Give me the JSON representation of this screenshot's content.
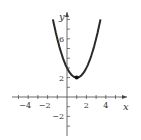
{
  "chart_data": {
    "type": "line",
    "title": "",
    "xlabel": "x",
    "ylabel": "y",
    "function": "y = x^2 - 2x + 3",
    "x": [
      -1.4,
      -1,
      -0.5,
      0,
      0.5,
      1,
      1.5,
      2,
      2.5,
      3,
      3.4
    ],
    "series": [
      {
        "name": "f(x)",
        "values": [
          7.76,
          6,
          4.25,
          3,
          2.25,
          2,
          2.25,
          3,
          4.25,
          6,
          7.76
        ]
      }
    ],
    "marked_point": {
      "x": 1,
      "y": 2
    },
    "x_ticks": [
      "-4",
      "-2",
      "2",
      "4"
    ],
    "y_ticks": [
      "-2",
      "2",
      "6"
    ],
    "xlim": [
      -5.5,
      5.5
    ],
    "ylim": [
      -3.5,
      8.5
    ],
    "grid": false,
    "legend": "none"
  }
}
